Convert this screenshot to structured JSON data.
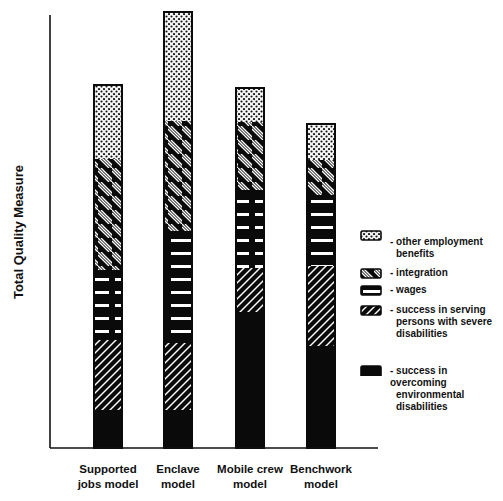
{
  "chart_data": {
    "type": "bar",
    "stacked": true,
    "title": "",
    "xlabel": "",
    "ylabel": "Total Quality Measure",
    "y_ticks": "none (relative scale, pixel units)",
    "grid": false,
    "legend_position": "right",
    "categories": [
      [
        "Supported",
        "jobs model"
      ],
      [
        "Enclave",
        "model"
      ],
      [
        "Mobile crew",
        "model"
      ],
      [
        "Benchwork",
        "model"
      ]
    ],
    "category_labels": [
      "Supported jobs model",
      "Enclave model",
      "Mobile crew model",
      "Benchwork model"
    ],
    "series": [
      {
        "name": "success in overcoming environmental disabilities",
        "pattern": "solid",
        "values": [
          38,
          38,
          136,
          102
        ]
      },
      {
        "name": "success in serving persons with severe disabilities",
        "pattern": "forward-hatch",
        "values": [
          70,
          67,
          44,
          80
        ]
      },
      {
        "name": "wages",
        "pattern": "horizontal-bars",
        "values": [
          70,
          112,
          78,
          71
        ]
      },
      {
        "name": "integration",
        "pattern": "back-hatch",
        "values": [
          111,
          110,
          68,
          35
        ]
      },
      {
        "name": "other employment benefits",
        "pattern": "dots",
        "values": [
          74,
          109,
          34,
          36
        ]
      }
    ],
    "totals": [
      363,
      436,
      360,
      324
    ],
    "ylim": [
      0,
      440
    ]
  },
  "legend": {
    "items": [
      {
        "pattern": "dots",
        "lines": [
          "- other employment",
          "benefits"
        ],
        "y": 0
      },
      {
        "pattern": "back-hatch",
        "lines": [
          "- integration"
        ],
        "y": 38
      },
      {
        "pattern": "horizontal-bars",
        "lines": [
          "- wages"
        ],
        "y": 55
      },
      {
        "pattern": "forward-hatch",
        "lines": [
          "- success in serving",
          "persons with severe",
          "disabilities"
        ],
        "y": 75
      },
      {
        "pattern": "solid",
        "lines": [
          "- success in overcoming",
          "environmental",
          "disabilities"
        ],
        "y": 135
      }
    ]
  },
  "axis": {
    "y_label": "Total Quality Measure"
  },
  "colors": {
    "ink": "#0a0a0a",
    "paper": "#ffffff"
  }
}
